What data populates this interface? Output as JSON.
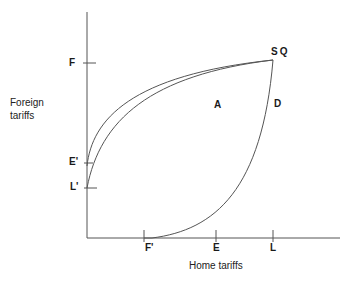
{
  "diagram": {
    "y_axis_title_line1": "Foreign",
    "y_axis_title_line2": "tariffs",
    "x_axis_title": "Home tariffs",
    "y_ticks": [
      {
        "label": "F",
        "y": 63
      },
      {
        "label": "E'",
        "y": 163
      },
      {
        "label": "L'",
        "y": 188
      }
    ],
    "x_ticks": [
      {
        "label": "F'",
        "x": 144
      },
      {
        "label": "E",
        "x": 216
      },
      {
        "label": "L",
        "x": 273
      }
    ],
    "point_label": "SQ",
    "region_labels": {
      "a": "A",
      "d": "D"
    },
    "line_color": "#444444",
    "curves": [
      {
        "name": "curve-from-E-prime-to-SQ",
        "from": "E'",
        "to": "SQ"
      },
      {
        "name": "curve-from-L-prime-to-SQ",
        "from": "L'",
        "to": "SQ"
      },
      {
        "name": "curve-from-F-prime-to-SQ",
        "from": "F'",
        "to": "SQ"
      }
    ]
  }
}
